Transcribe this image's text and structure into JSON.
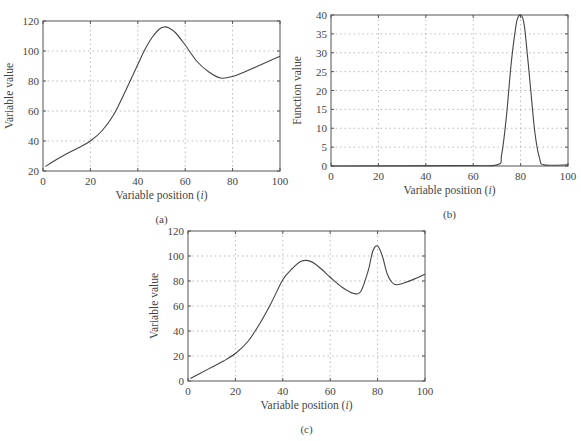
{
  "chart_data": [
    {
      "id": "a",
      "type": "line",
      "caption": "(a)",
      "title": "",
      "xlabel": "Variable position (i)",
      "ylabel": "Variable value",
      "xlim": [
        0,
        100
      ],
      "ylim": [
        20,
        120
      ],
      "xticks": [
        0,
        20,
        40,
        60,
        80,
        100
      ],
      "yticks": [
        20,
        40,
        60,
        80,
        100,
        120
      ],
      "grid": true,
      "frame": {
        "x0": 43,
        "x1": 280,
        "y0": 171,
        "y1": 21
      },
      "series": [
        {
          "name": "variable value",
          "x": [
            1,
            5,
            10,
            15,
            20,
            25,
            30,
            35,
            40,
            43,
            46,
            49,
            51,
            53,
            56,
            60,
            65,
            70,
            75,
            80,
            85,
            90,
            95,
            100
          ],
          "y": [
            23,
            27,
            31.5,
            35.5,
            40,
            47,
            58,
            74,
            91,
            101,
            109,
            114.5,
            116,
            115.5,
            112,
            104,
            93,
            86,
            82,
            83,
            86,
            89.5,
            93,
            96.5
          ]
        }
      ]
    },
    {
      "id": "b",
      "type": "line",
      "caption": "(b)",
      "title": "",
      "xlabel": "Variable position (i)",
      "ylabel": "Function value",
      "xlim": [
        0,
        100
      ],
      "ylim": [
        0,
        40
      ],
      "xticks": [
        0,
        20,
        40,
        60,
        80,
        100
      ],
      "yticks": [
        0,
        5,
        10,
        15,
        20,
        25,
        30,
        35,
        40
      ],
      "grid": true,
      "frame": {
        "x0": 331,
        "x1": 568,
        "y0": 166,
        "y1": 15
      },
      "series": [
        {
          "name": "function value",
          "x": [
            0,
            55,
            70,
            72,
            74,
            76,
            78,
            79,
            80,
            81,
            82,
            84,
            86,
            88,
            90,
            100
          ],
          "y": [
            0,
            0.1,
            0.3,
            3,
            13,
            27,
            37,
            39.5,
            40,
            39,
            35,
            22,
            9,
            2,
            0.3,
            0.3
          ]
        }
      ]
    },
    {
      "id": "c",
      "type": "line",
      "caption": "(c)",
      "title": "",
      "xlabel": "Variable position (i)",
      "ylabel": "Variable value",
      "xlim": [
        0,
        100
      ],
      "ylim": [
        0,
        120
      ],
      "xticks": [
        0,
        20,
        40,
        60,
        80,
        100
      ],
      "yticks": [
        0,
        20,
        40,
        60,
        80,
        100,
        120
      ],
      "grid": true,
      "frame": {
        "x0": 188,
        "x1": 425,
        "y0": 381,
        "y1": 231
      },
      "series": [
        {
          "name": "variable value",
          "x": [
            1,
            5,
            10,
            15,
            20,
            25,
            30,
            35,
            40,
            44,
            48,
            52,
            56,
            60,
            65,
            70,
            73,
            76,
            78,
            80,
            82,
            84,
            86,
            88,
            92,
            96,
            100
          ],
          "y": [
            2,
            6,
            11,
            16,
            22,
            31,
            45,
            62,
            81,
            90,
            96,
            95.5,
            90,
            83,
            75,
            70,
            72,
            88,
            104,
            108,
            100,
            86,
            79,
            77,
            79,
            82,
            85.5
          ]
        }
      ]
    }
  ]
}
